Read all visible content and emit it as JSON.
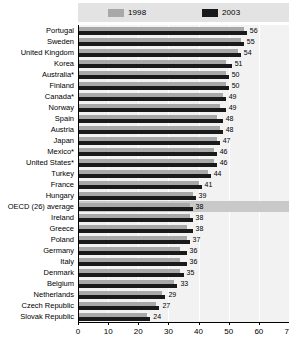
{
  "legend": {
    "items": [
      {
        "label": "1998",
        "color": "#a8a8a8",
        "icon": "legend-swatch-icon"
      },
      {
        "label": "2003",
        "color": "#1a1a1a",
        "icon": "legend-swatch-icon"
      }
    ]
  },
  "axis": {
    "x_ticks": [
      "0",
      "10",
      "20",
      "30",
      "40",
      "50",
      "60",
      "70"
    ]
  },
  "chart_data": {
    "type": "bar",
    "title": "",
    "subtitle": "",
    "xlabel": "",
    "ylabel": "",
    "orientation": "horizontal",
    "grid": true,
    "legend_position": "top",
    "xlim": [
      0,
      70
    ],
    "xticks": [
      0,
      10,
      20,
      30,
      40,
      50,
      60,
      70
    ],
    "categories": [
      "Portugal",
      "Sweden",
      "United Kingdom",
      "Korea",
      "Australia*",
      "Finland",
      "Canada*",
      "Norway",
      "Spain",
      "Austria",
      "Japan",
      "Mexico*",
      "United States*",
      "Turkey",
      "France",
      "Hungary",
      "OECD (26) average",
      "Ireland",
      "Greece",
      "Poland",
      "Germany",
      "Italy",
      "Denmark",
      "Belgium",
      "Netherlands",
      "Czech Republic",
      "Slovak Republic"
    ],
    "highlight_category": "OECD (26) average",
    "series": [
      {
        "name": "1998",
        "color": "#a8a8a8",
        "values": [
          55,
          54,
          53,
          49,
          49,
          49,
          48,
          47,
          46,
          47,
          46,
          45,
          45,
          43,
          40,
          38,
          37,
          37,
          36,
          36,
          34,
          34,
          34,
          32,
          28,
          26,
          23
        ]
      },
      {
        "name": "2003",
        "color": "#1a1a1a",
        "values": [
          56,
          55,
          54,
          51,
          50,
          50,
          49,
          49,
          48,
          48,
          47,
          46,
          46,
          44,
          41,
          39,
          38,
          38,
          38,
          37,
          36,
          36,
          35,
          33,
          29,
          27,
          24
        ]
      }
    ],
    "value_labels": [
      56,
      55,
      54,
      51,
      50,
      50,
      49,
      49,
      48,
      48,
      47,
      46,
      46,
      44,
      41,
      39,
      38,
      38,
      38,
      37,
      36,
      36,
      35,
      33,
      29,
      27,
      24
    ],
    "annotations": [
      "* denotes countries marked with an asterisk"
    ]
  }
}
